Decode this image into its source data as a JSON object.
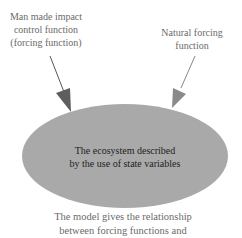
{
  "labels": {
    "man_made": [
      "Man made impact",
      "control function",
      "(forcing function)"
    ],
    "natural": [
      "Natural forcing",
      "function"
    ]
  },
  "ecosystem": {
    "lines": [
      "The ecosystem described",
      "by the use of state variables"
    ]
  },
  "caption": {
    "lines": [
      "The model gives the relationship",
      "between forcing functions and"
    ]
  },
  "colors": {
    "ellipse_fill": "#a9a9a9",
    "arrow_dark": "#5e5e5e",
    "arrow_light": "#8a8a8a",
    "label_text": "#6a6a6a",
    "ellipse_text": "#1e1e1e"
  }
}
